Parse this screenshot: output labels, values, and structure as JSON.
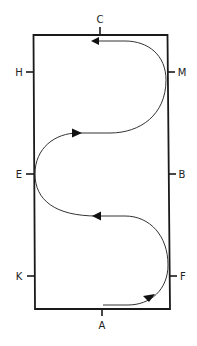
{
  "diagram": {
    "title": "",
    "type": "dressage-arena-serpentine",
    "colors": {
      "line": "#1a1a1a",
      "path": "#333333",
      "background": "#ffffff"
    },
    "markers": {
      "top": "C",
      "bottom": "A",
      "left_top": "H",
      "left_middle": "E",
      "left_bottom": "K",
      "right_top": "M",
      "right_middle": "B",
      "right_bottom": "F"
    },
    "route": {
      "description": "Three-loop serpentine from A to C",
      "start": "A",
      "end": "C",
      "loops": 3,
      "arrows": [
        {
          "position": "near F",
          "direction": "up-right"
        },
        {
          "position": "between F-K and B-E loops",
          "direction": "left"
        },
        {
          "position": "between E and M-H loops",
          "direction": "right"
        },
        {
          "position": "at C",
          "direction": "left"
        }
      ]
    }
  }
}
